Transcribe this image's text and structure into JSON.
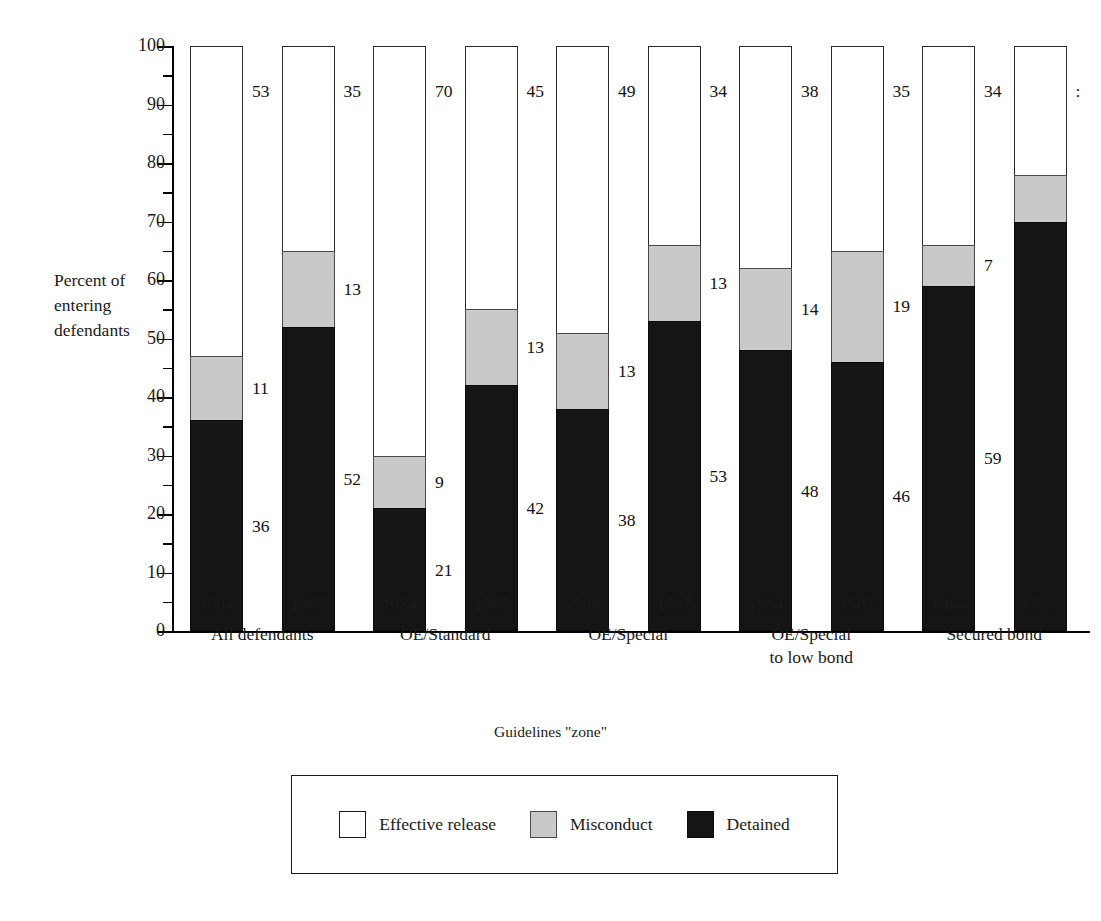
{
  "chart_data": {
    "type": "bar",
    "subtype": "stacked-column-100",
    "title": "",
    "xlabel": "Guidelines \"zone\"",
    "ylabel": "Percent of\nentering\ndefendants",
    "ylim": [
      0,
      100
    ],
    "yticks": [
      0,
      10,
      20,
      30,
      40,
      50,
      60,
      70,
      80,
      90,
      100
    ],
    "ytick_labels": [
      "0",
      "10",
      "20",
      "30",
      "40",
      "50",
      "60",
      "70",
      "80",
      "90",
      "100"
    ],
    "grid": false,
    "legend_position": "bottom",
    "legend": [
      "Effective release",
      "Misconduct",
      "Detained"
    ],
    "colors": {
      "effective_release": "#ffffff",
      "misconduct": "#c9c9c9",
      "detained": "#151515",
      "axis": "#000000",
      "text": "#1a1a1a"
    },
    "groups": [
      {
        "label": "All defendants",
        "years": [
          "1984",
          "1987"
        ]
      },
      {
        "label": "OE/Standard",
        "years": [
          "1984",
          "1987"
        ]
      },
      {
        "label": "OE/Special",
        "years": [
          "1984",
          "1987"
        ]
      },
      {
        "label": "OE/Special\nto low bond",
        "years": [
          "1984",
          "1987"
        ]
      },
      {
        "label": "Secured bond",
        "years": [
          "1984",
          "1987"
        ]
      }
    ],
    "categories": [
      "All defendants 1984",
      "All defendants 1987",
      "OE/Standard 1984",
      "OE/Standard 1987",
      "OE/Special 1984",
      "OE/Special 1987",
      "OE/Special to low bond 1984",
      "OE/Special to low bond 1987",
      "Secured bond 1984",
      "Secured bond 1987"
    ],
    "series": [
      {
        "name": "Detained",
        "values": [
          36,
          52,
          21,
          42,
          38,
          53,
          48,
          46,
          59,
          70
        ]
      },
      {
        "name": "Misconduct",
        "values": [
          11,
          13,
          9,
          13,
          13,
          13,
          14,
          19,
          7,
          8
        ]
      },
      {
        "name": "Effective release",
        "values": [
          53,
          35,
          70,
          45,
          49,
          34,
          38,
          35,
          34,
          22
        ]
      }
    ],
    "bars": [
      {
        "group": "All defendants",
        "year": "1984",
        "detained": 36,
        "misconduct": 11,
        "release": 53,
        "detained_label": "36",
        "misconduct_label": "11",
        "release_label": "53"
      },
      {
        "group": "All defendants",
        "year": "1987",
        "detained": 52,
        "misconduct": 13,
        "release": 35,
        "detained_label": "52",
        "misconduct_label": "13",
        "release_label": "35"
      },
      {
        "group": "OE/Standard",
        "year": "1984",
        "detained": 21,
        "misconduct": 9,
        "release": 70,
        "detained_label": "21",
        "misconduct_label": "9",
        "release_label": "70"
      },
      {
        "group": "OE/Standard",
        "year": "1987",
        "detained": 42,
        "misconduct": 13,
        "release": 45,
        "detained_label": "42",
        "misconduct_label": "13",
        "release_label": "45"
      },
      {
        "group": "OE/Special",
        "year": "1984",
        "detained": 38,
        "misconduct": 13,
        "release": 49,
        "detained_label": "38",
        "misconduct_label": "13",
        "release_label": "49"
      },
      {
        "group": "OE/Special",
        "year": "1987",
        "detained": 53,
        "misconduct": 13,
        "release": 34,
        "detained_label": "53",
        "misconduct_label": "13",
        "release_label": "34"
      },
      {
        "group": "OE/Special to low bond",
        "year": "1984",
        "detained": 48,
        "misconduct": 14,
        "release": 38,
        "detained_label": "48",
        "misconduct_label": "14",
        "release_label": "38"
      },
      {
        "group": "OE/Special to low bond",
        "year": "1987",
        "detained": 46,
        "misconduct": 19,
        "release": 35,
        "detained_label": "46",
        "misconduct_label": "19",
        "release_label": "35"
      },
      {
        "group": "Secured bond",
        "year": "1984",
        "detained": 59,
        "misconduct": 7,
        "release": 34,
        "detained_label": "59",
        "misconduct_label": "7",
        "release_label": "34"
      },
      {
        "group": "Secured bond",
        "year": "1987",
        "detained": 70,
        "misconduct": 8,
        "release": 22,
        "detained_label": "",
        "misconduct_label": "",
        "release_label": ":"
      }
    ]
  }
}
